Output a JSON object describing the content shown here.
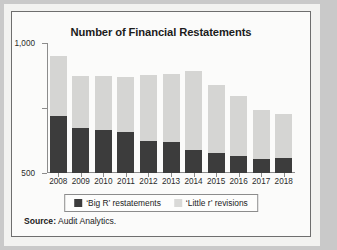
{
  "figure": {
    "source_label": "Source:",
    "source_text": "Audit Analytics.",
    "frame_color": "#6e6e6e",
    "background_color": "#fbfbfa",
    "page_background": "#c9c9c9"
  },
  "legend": {
    "position": "bottom-center",
    "entries": [
      {
        "label": "‘Big R’ restatements",
        "color": "#3c3c3c",
        "swatch": "big-r-swatch"
      },
      {
        "label": "‘Little r’ revisions",
        "color": "#d9d9d7",
        "swatch": "little-r-swatch"
      }
    ]
  },
  "chart_data": {
    "type": "bar",
    "subtype": "stacked",
    "title": "Number of Financial Restatements",
    "xlabel": "",
    "ylabel": "",
    "categories": [
      "2008",
      "2009",
      "2010",
      "2011",
      "2012",
      "2013",
      "2014",
      "2015",
      "2016",
      "2017",
      "2018"
    ],
    "series": [
      {
        "name": "‘Big R’ restatements",
        "color": "#3c3c3c",
        "values": [
          440,
          345,
          330,
          315,
          250,
          235,
          180,
          155,
          130,
          110,
          115
        ]
      },
      {
        "name": "‘Little r’ revisions",
        "color": "#d5d5d3",
        "values": [
          460,
          405,
          415,
          425,
          505,
          525,
          605,
          520,
          460,
          375,
          340
        ]
      }
    ],
    "totals": [
      900,
      750,
      745,
      740,
      755,
      760,
      785,
      675,
      590,
      485,
      455
    ],
    "ylim": [
      0,
      1000
    ],
    "yticks": [
      0,
      500,
      1000
    ],
    "ytick_labels": [
      "0",
      "500",
      "1,000"
    ],
    "grid": false,
    "legend_position": "bottom-center"
  }
}
